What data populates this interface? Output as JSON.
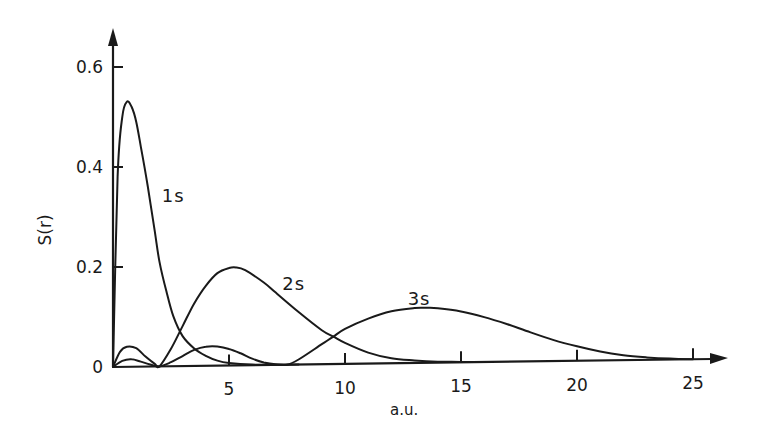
{
  "chart_data": {
    "type": "line",
    "title": "",
    "xlabel": "a.u.",
    "ylabel": "S(r)",
    "xlim": [
      0,
      26.5
    ],
    "ylim": [
      0,
      0.67
    ],
    "grid": false,
    "legend": "inline curve labels",
    "x_ticks": [
      {
        "value": 5,
        "label": "5"
      },
      {
        "value": 10,
        "label": "10"
      },
      {
        "value": 15,
        "label": "15"
      },
      {
        "value": 20,
        "label": "20"
      },
      {
        "value": 25,
        "label": "25"
      }
    ],
    "y_ticks": [
      {
        "value": 0,
        "label": "0"
      },
      {
        "value": 0.2,
        "label": "0.2"
      },
      {
        "value": 0.4,
        "label": "0.4"
      },
      {
        "value": 0.6,
        "label": "0.6"
      }
    ],
    "series": [
      {
        "name": "1s",
        "label_pos": {
          "x": 2.1,
          "y": 0.33
        },
        "x": [
          0,
          0.2,
          0.4,
          0.6,
          0.8,
          1.0,
          1.2,
          1.5,
          1.8,
          2.0,
          2.3,
          2.6,
          3.0,
          3.5,
          4.0,
          4.5,
          5.0,
          6.0,
          7.0,
          8.0
        ],
        "y": [
          0,
          0.38,
          0.5,
          0.53,
          0.52,
          0.49,
          0.44,
          0.36,
          0.27,
          0.21,
          0.15,
          0.1,
          0.06,
          0.035,
          0.02,
          0.01,
          0.005,
          0.001,
          0,
          0
        ]
      },
      {
        "name": "2s",
        "label_pos": {
          "x": 7.3,
          "y": 0.155
        },
        "x": [
          0,
          0.3,
          0.6,
          1.0,
          1.4,
          1.8,
          2.0,
          2.5,
          3.0,
          3.5,
          4.0,
          4.5,
          5.0,
          5.3,
          5.7,
          6.5,
          7.0,
          8.0,
          9.0,
          9.5,
          10.0,
          11.0,
          12.0,
          13.0,
          14.0,
          15.0,
          16.0
        ],
        "y": [
          0,
          0.03,
          0.04,
          0.037,
          0.02,
          0.005,
          0,
          0.035,
          0.08,
          0.125,
          0.16,
          0.185,
          0.195,
          0.196,
          0.19,
          0.165,
          0.145,
          0.105,
          0.068,
          0.055,
          0.042,
          0.022,
          0.01,
          0.005,
          0.002,
          0.001,
          0
        ]
      },
      {
        "name": "3s",
        "label_pos": {
          "x": 12.7,
          "y": 0.125
        },
        "x": [
          0,
          0.4,
          0.8,
          1.2,
          1.6,
          2.0,
          2.5,
          3.0,
          3.5,
          4.0,
          4.5,
          5.0,
          5.5,
          6.0,
          6.5,
          7.0,
          7.5,
          8.0,
          9.0,
          9.5,
          10.0,
          11.0,
          12.0,
          13.0,
          13.5,
          14.0,
          15.0,
          16.0,
          17.0,
          18.0,
          19.0,
          20.0,
          21.0,
          22.0,
          23.0,
          24.0,
          25.0
        ],
        "y": [
          0,
          0.012,
          0.015,
          0.01,
          0.004,
          0,
          0.008,
          0.02,
          0.032,
          0.038,
          0.038,
          0.033,
          0.024,
          0.013,
          0.005,
          0.001,
          0,
          0.01,
          0.04,
          0.055,
          0.07,
          0.09,
          0.104,
          0.11,
          0.11,
          0.109,
          0.102,
          0.09,
          0.075,
          0.058,
          0.042,
          0.029,
          0.018,
          0.01,
          0.005,
          0.002,
          0
        ]
      }
    ]
  },
  "labels": {
    "x_axis_title": "a.u.",
    "y_axis_title": "S(r)"
  }
}
